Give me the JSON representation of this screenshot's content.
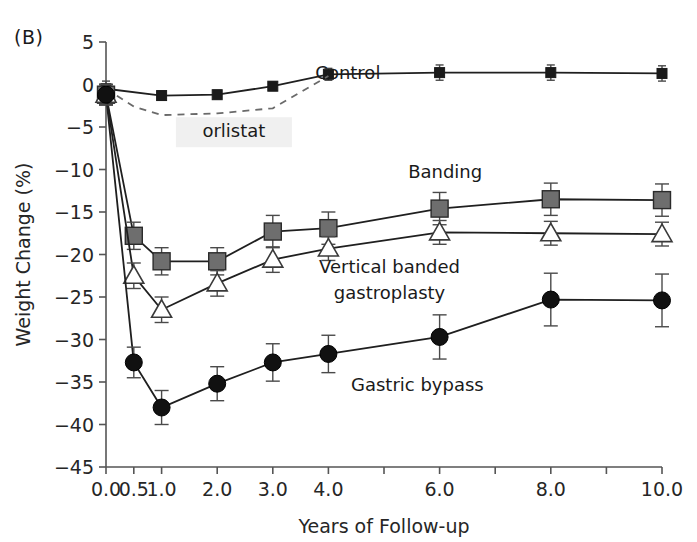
{
  "figure": {
    "panel_label": "(B)",
    "background_color": "#ffffff",
    "width": 697,
    "height": 542
  },
  "chart_data": {
    "type": "line",
    "title": "",
    "subtitle": "",
    "xlabel": "Years of Follow-up",
    "ylabel": "Weight Change (%)",
    "xlim": [
      0,
      10
    ],
    "ylim": [
      -45,
      5
    ],
    "grid": false,
    "legend_position": "inline-annotations",
    "x_ticks": [
      0.0,
      0.5,
      1.0,
      2.0,
      3.0,
      4.0,
      5.0,
      6.0,
      7.0,
      8.0,
      9.0,
      10.0
    ],
    "x_tick_labels": [
      "0.0",
      "0.5",
      "1.0",
      "2.0",
      "3.0",
      "4.0",
      "",
      "6.0",
      "",
      "8.0",
      "",
      "10.0"
    ],
    "y_ticks": [
      5,
      0,
      -5,
      -10,
      -15,
      -20,
      -25,
      -30,
      -35,
      -40,
      -45
    ],
    "y_tick_labels": [
      "5",
      "0",
      "−5",
      "−10",
      "−15",
      "−20",
      "−25",
      "−30",
      "−35",
      "−40",
      "−45"
    ],
    "series": [
      {
        "name": "Control",
        "marker": "filled-square-small",
        "color": "#1a1a1a",
        "line_style": "solid",
        "x": [
          0.0,
          1.0,
          2.0,
          3.0,
          4.0,
          6.0,
          8.0,
          10.0
        ],
        "values": [
          -0.5,
          -1.3,
          -1.2,
          -0.2,
          1.2,
          1.4,
          1.4,
          1.3
        ],
        "errors": [
          0.9,
          0.5,
          0.5,
          0.5,
          0.7,
          0.9,
          0.9,
          0.9
        ],
        "label_x": 4.35,
        "label_y": 0.6
      },
      {
        "name": "orlistat",
        "marker": "none",
        "color": "#555555",
        "line_style": "dashed",
        "x": [
          0.0,
          0.5,
          1.0,
          2.0,
          3.0,
          4.0
        ],
        "values": [
          -0.5,
          -2.6,
          -3.6,
          -3.4,
          -2.8,
          1.0
        ],
        "errors": [
          0,
          0,
          0,
          0,
          0,
          0
        ],
        "label_x": 2.3,
        "label_y": -6.2
      },
      {
        "name": "Banding",
        "marker": "filled-square-gray",
        "color": "#6e6e6e",
        "line_style": "solid",
        "x": [
          0.0,
          0.5,
          1.0,
          2.0,
          3.0,
          4.0,
          6.0,
          8.0,
          10.0
        ],
        "values": [
          -1.2,
          -17.8,
          -20.8,
          -20.8,
          -17.3,
          -16.9,
          -14.6,
          -13.5,
          -13.6
        ],
        "errors": [
          1.2,
          1.6,
          1.6,
          1.6,
          1.9,
          1.9,
          1.9,
          1.9,
          1.9
        ],
        "label_x": 6.1,
        "label_y": -11.0
      },
      {
        "name": "Vertical banded gastroplasty",
        "marker": "open-triangle",
        "color": "#3a3a3a",
        "line_style": "solid",
        "x": [
          0.0,
          0.5,
          1.0,
          2.0,
          3.0,
          4.0,
          6.0,
          8.0,
          10.0
        ],
        "values": [
          -1.2,
          -22.5,
          -26.5,
          -23.4,
          -20.6,
          -19.3,
          -17.4,
          -17.5,
          -17.6
        ],
        "errors": [
          1.2,
          1.5,
          1.5,
          1.5,
          1.5,
          1.4,
          1.4,
          1.4,
          1.4
        ],
        "label_line1": "Vertical banded",
        "label_line2": "gastroplasty",
        "label_x": 5.1,
        "label_y": -22.2
      },
      {
        "name": "Gastric bypass",
        "marker": "filled-circle",
        "color": "#111111",
        "line_style": "solid",
        "x": [
          0.0,
          0.5,
          1.0,
          2.0,
          3.0,
          4.0,
          6.0,
          8.0,
          10.0
        ],
        "values": [
          -1.2,
          -32.7,
          -38.0,
          -35.2,
          -32.7,
          -31.7,
          -29.7,
          -25.3,
          -25.4
        ],
        "errors": [
          1.2,
          1.8,
          2.0,
          2.0,
          2.2,
          2.2,
          2.6,
          3.1,
          3.1
        ],
        "label_x": 5.6,
        "label_y": -36.1
      }
    ]
  }
}
